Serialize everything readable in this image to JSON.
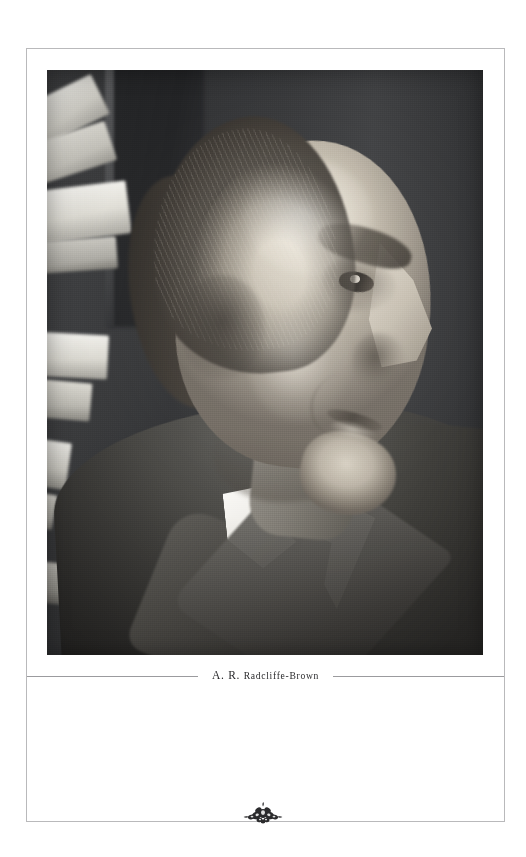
{
  "page": {
    "kind": "book-plate-page",
    "background_color": "#ffffff",
    "frame_color": "#b9b9bb"
  },
  "plate": {
    "name": "portrait-photograph",
    "alt": "Black and white profile photograph of an elderly man facing right, seated before a dark background with books at the left",
    "medium": "black-and-white photograph",
    "subject_pose": "right-facing profile",
    "tones": {
      "background": "#313234",
      "highlight": "#f2f1ec",
      "midtone": "#8b8377",
      "shadow": "#222120"
    }
  },
  "caption": {
    "initials": "A. R. ",
    "surname": "Radcliffe-Brown",
    "full_text": "A. R. Radcliffe-Brown",
    "rule_color": "#9b9b9e"
  },
  "ornament": {
    "name": "floral-fleuron-ornament",
    "color": "#2b2b2d",
    "description": "small dark floral cluster centered on the bottom rule"
  }
}
